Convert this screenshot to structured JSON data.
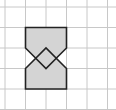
{
  "diagram": {
    "type": "grid-geometry",
    "grid": {
      "columns": 5,
      "rows": 5,
      "cell_size": 20.5,
      "origin_x": 5,
      "origin_y": 7,
      "line_color": "#c8c8c8"
    },
    "shape": {
      "fill": "#d4d4d4",
      "stroke": "#222222",
      "outline_points_grid": [
        [
          1,
          1
        ],
        [
          3,
          1
        ],
        [
          3,
          2
        ],
        [
          2.5,
          2.5
        ],
        [
          3,
          3
        ],
        [
          3,
          4
        ],
        [
          1,
          4
        ],
        [
          1,
          3
        ],
        [
          1.5,
          2.5
        ],
        [
          1,
          2
        ]
      ],
      "inner_diamond_points_grid": [
        [
          1.5,
          2.5
        ],
        [
          2,
          2
        ],
        [
          2.5,
          2.5
        ],
        [
          2,
          3
        ]
      ]
    }
  }
}
